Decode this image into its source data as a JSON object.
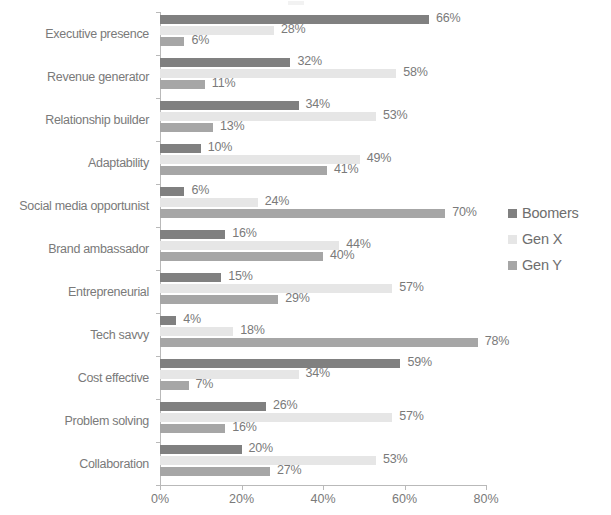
{
  "chart_data": {
    "type": "bar",
    "orientation": "horizontal",
    "title": "",
    "subtitle": "",
    "xlabel": "",
    "ylabel": "",
    "xlim": [
      0,
      80
    ],
    "grid": false,
    "legend_position": "right",
    "categories": [
      "Executive presence",
      "Revenue generator",
      "Relationship builder",
      "Adaptability",
      "Social media opportunist",
      "Brand ambassador",
      "Entrepreneurial",
      "Tech savvy",
      "Cost effective",
      "Problem solving",
      "Collaboration"
    ],
    "series": [
      {
        "name": "Boomers",
        "color": "#808080",
        "values": [
          66,
          32,
          34,
          10,
          6,
          16,
          15,
          4,
          59,
          26,
          20
        ],
        "labels": [
          "66%",
          "32%",
          "34%",
          "10%",
          "6%",
          "16%",
          "15%",
          "4%",
          "59%",
          "26%",
          "20%"
        ]
      },
      {
        "name": "Gen X",
        "color": "#e6e6e6",
        "values": [
          28,
          58,
          53,
          49,
          24,
          44,
          57,
          18,
          34,
          57,
          53
        ],
        "labels": [
          "28%",
          "58%",
          "53%",
          "49%",
          "24%",
          "44%",
          "57%",
          "18%",
          "34%",
          "57%",
          "53%"
        ]
      },
      {
        "name": "Gen Y",
        "color": "#a6a6a6",
        "values": [
          6,
          11,
          13,
          41,
          70,
          40,
          29,
          78,
          7,
          16,
          27
        ],
        "labels": [
          "6%",
          "11%",
          "13%",
          "41%",
          "70%",
          "40%",
          "29%",
          "78%",
          "7%",
          "16%",
          "27%"
        ]
      }
    ],
    "xticks": [
      0,
      20,
      40,
      60,
      80
    ],
    "xtick_labels": [
      "0%",
      "20%",
      "40%",
      "60%",
      "80%"
    ]
  },
  "legend": {
    "items": [
      {
        "label": "Boomers",
        "color": "#808080"
      },
      {
        "label": "Gen X",
        "color": "#e6e6e6"
      },
      {
        "label": "Gen Y",
        "color": "#a6a6a6"
      }
    ]
  },
  "axis": {
    "line_color": "#b9b9b9",
    "text_color": "#7a7a7a"
  }
}
